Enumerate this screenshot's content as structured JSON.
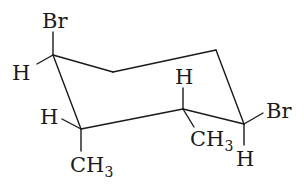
{
  "molecule": {
    "description": "chair conformation of substituted cyclohexane",
    "ring_carbons": [
      {
        "id": "C1",
        "x": 53,
        "y": 55
      },
      {
        "id": "C2",
        "x": 113,
        "y": 72
      },
      {
        "id": "C3",
        "x": 216,
        "y": 50
      },
      {
        "id": "C4",
        "x": 244,
        "y": 124
      },
      {
        "id": "C5",
        "x": 183,
        "y": 109
      },
      {
        "id": "C6",
        "x": 81,
        "y": 129
      }
    ],
    "labels": {
      "br_top": "Br",
      "h_c1": "H",
      "h_c6": "H",
      "ch3_c6_main": "CH",
      "ch3_c6_sub": "3",
      "h_c5": "H",
      "ch3_c5_main": "CH",
      "ch3_c5_sub": "3",
      "br_right": "Br",
      "h_c4": "H"
    }
  }
}
